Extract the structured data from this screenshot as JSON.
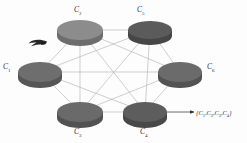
{
  "figure": {
    "background_color": "#fdfdfd",
    "edge_color": "#b9b9b9",
    "arrow_color": "#333333"
  },
  "nodes": [
    {
      "id": "c1",
      "label": "C",
      "sub": "1",
      "cx": 40,
      "cy": 72,
      "rx": 22,
      "ry": 10,
      "depth": 6,
      "top_color": "#6e6e6e",
      "side_color": "#565656"
    },
    {
      "id": "c2",
      "label": "C",
      "sub": "2",
      "cx": 80,
      "cy": 30,
      "rx": 23,
      "ry": 10,
      "depth": 6,
      "top_color": "#8c8c8c",
      "side_color": "#6d6d6d"
    },
    {
      "id": "c3",
      "label": "C",
      "sub": "3",
      "cx": 80,
      "cy": 112,
      "rx": 23,
      "ry": 10,
      "depth": 6,
      "top_color": "#6a6a6a",
      "side_color": "#525252"
    },
    {
      "id": "c4",
      "label": "C",
      "sub": "4",
      "cx": 145,
      "cy": 112,
      "rx": 22,
      "ry": 10,
      "depth": 6,
      "top_color": "#5d5d5d",
      "side_color": "#484848"
    },
    {
      "id": "c5",
      "label": "C",
      "sub": "5",
      "cx": 150,
      "cy": 30,
      "rx": 22,
      "ry": 9,
      "depth": 6,
      "top_color": "#5b5b5b",
      "side_color": "#464646"
    },
    {
      "id": "c6",
      "label": "C",
      "sub": "6",
      "cx": 180,
      "cy": 72,
      "rx": 22,
      "ry": 10,
      "depth": 6,
      "top_color": "#6b6b6b",
      "side_color": "#535353"
    }
  ],
  "edges": [
    {
      "from": "c1",
      "to": "c2"
    },
    {
      "from": "c1",
      "to": "c3"
    },
    {
      "from": "c1",
      "to": "c4"
    },
    {
      "from": "c1",
      "to": "c5"
    },
    {
      "from": "c1",
      "to": "c6"
    },
    {
      "from": "c2",
      "to": "c3"
    },
    {
      "from": "c2",
      "to": "c4"
    },
    {
      "from": "c2",
      "to": "c5"
    },
    {
      "from": "c2",
      "to": "c6"
    },
    {
      "from": "c3",
      "to": "c4"
    },
    {
      "from": "c3",
      "to": "c5"
    },
    {
      "from": "c3",
      "to": "c6"
    },
    {
      "from": "c4",
      "to": "c5"
    },
    {
      "from": "c4",
      "to": "c6"
    },
    {
      "from": "c5",
      "to": "c6"
    }
  ],
  "labels": {
    "c1": "C",
    "c1_sub": "1",
    "c2": "C",
    "c2_sub": "2",
    "c3": "C",
    "c3_sub": "3",
    "c4": "C",
    "c4_sub": "4",
    "c5": "C",
    "c5_sub": "5",
    "c6": "C",
    "c6_sub": "6"
  },
  "annotation": {
    "open_brace": "{",
    "items": [
      "C1",
      "C2",
      "C3",
      "C4"
    ],
    "close_brace": "}",
    "arrow_from_x": 167,
    "arrow_to_x": 194,
    "arrow_y": 112
  },
  "pointer_marker": {
    "name": "left-pointing-arrow-marker",
    "x": 28,
    "y": 40,
    "width": 20,
    "height": 8
  }
}
